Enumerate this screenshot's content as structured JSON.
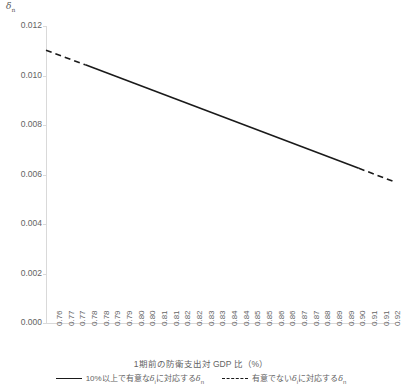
{
  "chart_data": {
    "type": "line",
    "title": "",
    "xlabel": "1期前の防衛支出対 GDP 比（%）",
    "ylabel": "δn",
    "ylim": [
      0.0,
      0.012
    ],
    "xlim": [
      0.76,
      0.92
    ],
    "grid": false,
    "legend_position": "bottom",
    "ytick_labels": [
      "0.000",
      "0.002",
      "0.004",
      "0.006",
      "0.008",
      "0.010",
      "0.012"
    ],
    "ytick_values": [
      0.0,
      0.002,
      0.004,
      0.006,
      0.008,
      0.01,
      0.012
    ],
    "xtick_labels": [
      "0.76",
      "0.77",
      "0.77",
      "0.78",
      "0.78",
      "0.79",
      "0.79",
      "0.80",
      "0.80",
      "0.81",
      "0.81",
      "0.82",
      "0.82",
      "0.83",
      "0.83",
      "0.84",
      "0.84",
      "0.85",
      "0.85",
      "0.86",
      "0.86",
      "0.87",
      "0.87",
      "0.88",
      "0.89",
      "0.89",
      "0.90",
      "0.91",
      "0.91",
      "0.92"
    ],
    "x": [
      0.76,
      0.765,
      0.77,
      0.775,
      0.78,
      0.785,
      0.79,
      0.795,
      0.8,
      0.805,
      0.81,
      0.815,
      0.82,
      0.825,
      0.83,
      0.835,
      0.84,
      0.845,
      0.85,
      0.855,
      0.86,
      0.865,
      0.87,
      0.875,
      0.885,
      0.89,
      0.9,
      0.91,
      0.915,
      0.92
    ],
    "series": [
      {
        "name": "10%以上で有意なδiに対応するδn",
        "style": "solid",
        "color": "#1a1a1a",
        "x": [
          0.778,
          0.903
        ],
        "values": [
          0.01043,
          0.00625
        ]
      },
      {
        "name": "有意でないδiに対応するδn",
        "style": "dashed",
        "color": "#1a1a1a",
        "segments": [
          {
            "x": [
              0.76,
              0.778
            ],
            "values": [
              0.01102,
              0.01043
            ]
          },
          {
            "x": [
              0.903,
              0.92
            ],
            "values": [
              0.00625,
              0.00568
            ]
          }
        ]
      }
    ],
    "annotations": []
  },
  "legend": {
    "entries": [
      {
        "label_prefix": "10%以上で有意な",
        "label_symbol": "δ",
        "label_sub": "i",
        "label_suffix": "に対応する",
        "label_symbol2": "δ",
        "label_sub2": "n",
        "style": "solid"
      },
      {
        "label_prefix": "有意でない",
        "label_symbol": "δ",
        "label_sub": "i",
        "label_suffix": "に対応する",
        "label_symbol2": "δ",
        "label_sub2": "n",
        "style": "dashed"
      }
    ]
  },
  "axis": {
    "y_title_symbol": "δ",
    "y_title_sub": "n",
    "x_title": "1期前の防衛支出対 GDP 比（%）"
  },
  "colors": {
    "line": "#1a1a1a",
    "axis": "#d9d9d9",
    "text": "#636363",
    "background": "#ffffff"
  }
}
